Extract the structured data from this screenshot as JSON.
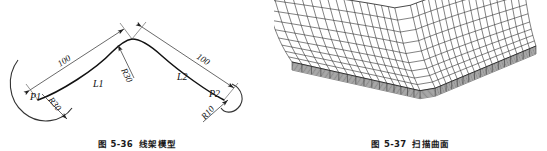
{
  "page": {
    "background": "#ffffff",
    "width": 547,
    "height": 151,
    "line_color": "#111111",
    "thin_line_color": "#555555"
  },
  "figures": [
    {
      "id": "wireframe-model",
      "caption_number": "图 5-36",
      "caption_title": "线架模型",
      "labels": {
        "dim_left": "100",
        "dim_right": "100",
        "curve_left": "L1",
        "curve_right": "L2",
        "point_left": "P1",
        "point_right": "P2",
        "radius_left": "R30",
        "radius_apex": "R30",
        "radius_right": "R10"
      }
    },
    {
      "id": "swept-surface",
      "caption_number": "图 5-37",
      "caption_title": "扫描曲面",
      "mesh": {
        "u_divisions": 34,
        "v_divisions": 9,
        "stroke": "#1a1a1a"
      }
    }
  ]
}
